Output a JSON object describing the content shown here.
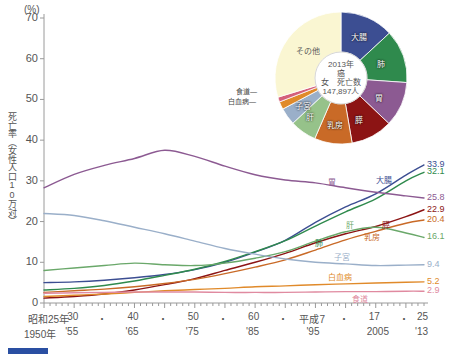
{
  "axes": {
    "unit": "(%)",
    "ylabel": "死亡率（女性人口10万対）",
    "yticks": [
      "70",
      "60",
      "50",
      "40",
      "30",
      "20",
      "10",
      "0"
    ],
    "ylim": [
      0,
      70
    ],
    "xtop": [
      "昭和25年",
      "30",
      "・",
      "40",
      "・",
      "50",
      "・",
      "60",
      "・",
      "平成7",
      "・",
      "17",
      "・",
      "25"
    ],
    "xbot": [
      "1950年",
      "'55",
      "'65",
      "'75",
      "'85",
      "'95",
      "2005",
      "'13"
    ],
    "xlim": [
      1950,
      2013
    ]
  },
  "pie": {
    "center": {
      "year": "2013年",
      "subject": "癌",
      "line3": "女　死亡数",
      "count": "147,897人"
    },
    "slices": [
      {
        "label": "大腸",
        "value": 13.1,
        "color": "#3c4e92"
      },
      {
        "label": "肺",
        "value": 13.0,
        "color": "#2f8a4d"
      },
      {
        "label": "胃",
        "value": 11.0,
        "color": "#8c5a92"
      },
      {
        "label": "膵",
        "value": 10.2,
        "color": "#8c1414"
      },
      {
        "label": "乳房",
        "value": 9.2,
        "color": "#c96a27"
      },
      {
        "label": "肝",
        "value": 6.5,
        "color": "#96c28a"
      },
      {
        "label": "子宮",
        "value": 4.2,
        "color": "#9aafc9"
      },
      {
        "label": "白血病",
        "value": 1.9,
        "color": "#e08a2a"
      },
      {
        "label": "食道",
        "value": 1.2,
        "color": "#d4607a"
      },
      {
        "label": "その他",
        "value": 29.7,
        "color": "#faf6d2"
      }
    ],
    "leaders": [
      {
        "label": "食道"
      },
      {
        "label": "白血病"
      }
    ]
  },
  "chart_data": {
    "type": "line",
    "title": "",
    "xlabel": "",
    "ylabel": "死亡率（女性人口10万対）",
    "ylim": [
      0,
      70
    ],
    "grid": false,
    "legend": "inline-labels",
    "x": [
      1950,
      1955,
      1960,
      1965,
      1970,
      1975,
      1980,
      1985,
      1990,
      1995,
      2000,
      2005,
      2010,
      2013
    ],
    "series": [
      {
        "name": "大腸",
        "color": "#3c4e92",
        "end_value": "33.9",
        "values": [
          5.0,
          5.2,
          5.6,
          6.2,
          7.0,
          8.2,
          10.0,
          12.5,
          15.4,
          19.8,
          23.6,
          26.8,
          31.4,
          33.9
        ]
      },
      {
        "name": "肺",
        "color": "#2f8a4d",
        "end_value": "32.1",
        "values": [
          3.2,
          3.6,
          4.3,
          5.4,
          6.8,
          8.3,
          10.2,
          12.6,
          15.3,
          18.9,
          22.4,
          25.6,
          30.0,
          32.1
        ]
      },
      {
        "name": "胃",
        "color": "#8c5a92",
        "end_value": "25.8",
        "values": [
          28.3,
          31.6,
          33.8,
          35.5,
          37.5,
          36.0,
          33.6,
          31.5,
          30.2,
          29.5,
          28.3,
          27.2,
          26.3,
          25.8
        ]
      },
      {
        "name": "膵",
        "color": "#8c1414",
        "end_value": "22.9",
        "values": [
          1.2,
          1.6,
          2.2,
          3.2,
          4.5,
          6.0,
          8.0,
          10.0,
          12.2,
          14.8,
          17.0,
          18.8,
          21.2,
          22.9
        ]
      },
      {
        "name": "乳房",
        "color": "#c96a27",
        "end_value": "20.4",
        "values": [
          2.6,
          3.0,
          3.4,
          4.0,
          4.8,
          5.8,
          7.2,
          8.8,
          10.6,
          13.0,
          15.5,
          17.6,
          19.6,
          20.4
        ]
      },
      {
        "name": "肝",
        "color": "#6aa86a",
        "end_value": "16.1",
        "values": [
          8.0,
          8.6,
          9.2,
          9.8,
          9.4,
          9.2,
          9.8,
          11.0,
          12.6,
          15.2,
          17.5,
          18.6,
          17.2,
          16.1
        ]
      },
      {
        "name": "子宮",
        "color": "#9aafc9",
        "end_value": "9.4",
        "values": [
          22.0,
          21.5,
          20.2,
          18.6,
          17.0,
          15.2,
          13.4,
          12.0,
          10.8,
          10.0,
          9.6,
          9.2,
          9.3,
          9.4
        ]
      },
      {
        "name": "白血病",
        "color": "#e08a2a",
        "end_value": "5.2",
        "values": [
          1.6,
          1.9,
          2.2,
          2.6,
          3.0,
          3.3,
          3.6,
          4.0,
          4.2,
          4.5,
          4.7,
          4.9,
          5.1,
          5.2
        ]
      },
      {
        "name": "食道",
        "color": "#e08aa0",
        "end_value": "2.9",
        "values": [
          2.4,
          2.5,
          2.6,
          2.7,
          2.7,
          2.7,
          2.6,
          2.6,
          2.6,
          2.7,
          2.8,
          2.8,
          2.9,
          2.9
        ]
      }
    ],
    "inline_labels": [
      {
        "name": "大腸"
      },
      {
        "name": "肺"
      },
      {
        "name": "胃"
      },
      {
        "name": "膵"
      },
      {
        "name": "乳房"
      },
      {
        "name": "肝"
      },
      {
        "name": "子宮"
      },
      {
        "name": "白血病"
      },
      {
        "name": "食道"
      }
    ]
  }
}
